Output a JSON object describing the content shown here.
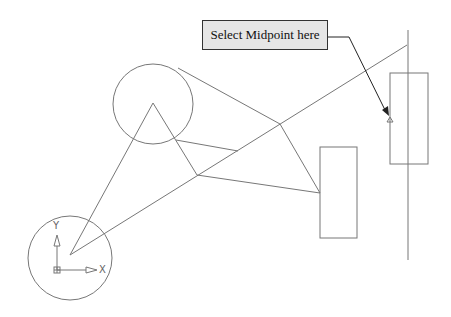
{
  "callout": {
    "text": "Select Midpoint here"
  },
  "ucs": {
    "x_label": "X",
    "y_label": "Y"
  },
  "colors": {
    "line": "#777777",
    "callout_bg": "#e6e6e6",
    "arrow": "#222222"
  }
}
